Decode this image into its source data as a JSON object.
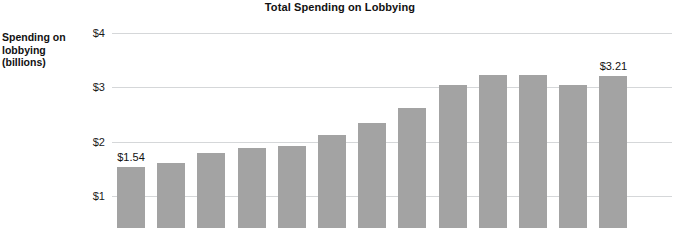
{
  "chart_data": {
    "type": "bar",
    "title": "Total Spending on Lobbying",
    "xlabel": "",
    "ylabel": "Spending on lobbying (billions)",
    "ylabel_lines": [
      "Spending on",
      "lobbying",
      "(billions)"
    ],
    "ylim": [
      0,
      4
    ],
    "grid": true,
    "legend": "none",
    "y_tick_labels": [
      "$1",
      "$2",
      "$3",
      "$4"
    ],
    "y_tick_values": [
      1,
      2,
      3,
      4
    ],
    "categories": [
      "",
      "",
      "",
      "",
      "",
      "",
      "",
      "",
      "",
      "",
      "",
      "",
      ""
    ],
    "values": [
      1.54,
      1.61,
      1.79,
      1.88,
      1.93,
      2.12,
      2.34,
      2.62,
      3.05,
      3.22,
      3.23,
      3.05,
      3.21
    ],
    "annotations": [
      {
        "index": 0,
        "text": "$1.54"
      },
      {
        "index": 12,
        "text": "$3.21"
      }
    ],
    "bar_color": "#a3a3a3",
    "gridline_color": "#d5d7d9",
    "background_color": "#ffffff",
    "title_color": "#111111"
  }
}
